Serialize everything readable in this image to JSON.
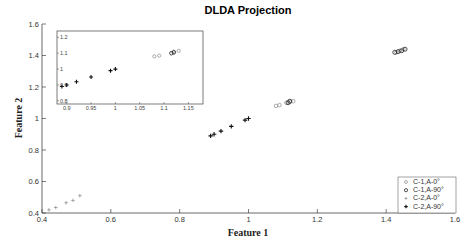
{
  "chart_data": {
    "type": "scatter",
    "title": "DLDA Projection",
    "xlabel": "Feature 1",
    "ylabel": "Feature 2",
    "xlim": [
      0.4,
      1.6
    ],
    "ylim": [
      0.4,
      1.6
    ],
    "xticks": [
      "0.4",
      "0.6",
      "0.8",
      "1",
      "1.2",
      "1.4",
      "1.6"
    ],
    "yticks": [
      "0.4",
      "0.6",
      "0.8",
      "1",
      "1.2",
      "1.4",
      "1.6"
    ],
    "grid": false,
    "legend_position": "lower right",
    "series": [
      {
        "name": "C-1,A-0°",
        "marker": "small-circle",
        "points": [
          [
            1.08,
            1.08
          ],
          [
            1.09,
            1.085
          ],
          [
            1.11,
            1.1
          ],
          [
            1.12,
            1.105
          ],
          [
            1.13,
            1.11
          ],
          [
            1.43,
            1.42
          ],
          [
            1.44,
            1.43
          ],
          [
            1.45,
            1.44
          ]
        ]
      },
      {
        "name": "C-1,A-90°",
        "marker": "circle",
        "points": [
          [
            1.115,
            1.1
          ],
          [
            1.12,
            1.11
          ],
          [
            1.425,
            1.42
          ],
          [
            1.435,
            1.425
          ],
          [
            1.445,
            1.43
          ],
          [
            1.455,
            1.44
          ]
        ]
      },
      {
        "name": "C-2,A-0°",
        "marker": "small-plus",
        "points": [
          [
            0.42,
            0.42
          ],
          [
            0.44,
            0.435
          ],
          [
            0.47,
            0.465
          ],
          [
            0.49,
            0.48
          ],
          [
            0.51,
            0.51
          ]
        ]
      },
      {
        "name": "C-2,A-90°",
        "marker": "plus",
        "points": [
          [
            0.89,
            0.89
          ],
          [
            0.9,
            0.9
          ],
          [
            0.92,
            0.92
          ],
          [
            0.95,
            0.95
          ],
          [
            0.99,
            0.99
          ],
          [
            1.0,
            1.0
          ]
        ]
      }
    ],
    "inset": {
      "xlim": [
        0.88,
        1.18
      ],
      "ylim": [
        0.78,
        1.24
      ],
      "xticks": [
        "0.9",
        "0.95",
        "1",
        "1.05",
        "1.1",
        "1.15"
      ],
      "yticks": [
        "0.8",
        "0.9",
        "1",
        "1.1",
        "1.2"
      ],
      "series": [
        {
          "name": "C-1,A-0°",
          "marker": "small-circle",
          "points": [
            [
              1.08,
              1.08
            ],
            [
              1.09,
              1.085
            ],
            [
              1.12,
              1.11
            ],
            [
              1.13,
              1.115
            ]
          ]
        },
        {
          "name": "C-1,A-90°",
          "marker": "circle",
          "points": [
            [
              1.115,
              1.1
            ],
            [
              1.12,
              1.105
            ]
          ]
        },
        {
          "name": "C-2,A-90°",
          "marker": "plus",
          "points": [
            [
              0.89,
              0.89
            ],
            [
              0.9,
              0.9
            ],
            [
              0.92,
              0.92
            ],
            [
              0.95,
              0.95
            ],
            [
              0.99,
              0.99
            ],
            [
              1.0,
              1.0
            ]
          ]
        }
      ]
    }
  },
  "legend": {
    "items": [
      {
        "label": "C-1,A-0°"
      },
      {
        "label": "C-1,A-90°"
      },
      {
        "label": "C-2,A-0°"
      },
      {
        "label": "C-2,A-90°"
      }
    ]
  }
}
